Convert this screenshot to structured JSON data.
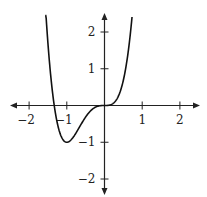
{
  "chart_data": {
    "type": "line",
    "title": "",
    "xlabel": "",
    "ylabel": "",
    "function": "f(x) = 3x^4 + 4x^3",
    "xlim": [
      -2.5,
      2.5
    ],
    "ylim": [
      -2.5,
      2.5
    ],
    "grid": false,
    "legend": null,
    "x_ticks": [
      -2,
      -1,
      1,
      2
    ],
    "x_tick_labels": [
      "−2",
      "−1",
      "1",
      "2"
    ],
    "y_ticks": [
      -2,
      -1,
      1,
      2
    ],
    "y_tick_labels": [
      "−2",
      "−1",
      "1",
      "2"
    ],
    "series": [
      {
        "name": "curve",
        "x": [
          -1.57,
          -1.5,
          -1.4,
          -1.333,
          -1.25,
          -1.1,
          -1.0,
          -0.9,
          -0.75,
          -0.5,
          -0.25,
          0.0,
          0.25,
          0.5,
          0.6,
          0.7,
          0.73
        ],
        "y": [
          2.45,
          1.69,
          0.55,
          0.0,
          -0.48,
          -0.93,
          -1.0,
          -0.95,
          -0.42,
          -0.31,
          -0.05,
          0.0,
          0.07,
          0.69,
          1.25,
          2.09,
          2.41
        ]
      }
    ],
    "annotations": {
      "local_min": [
        -1,
        -1
      ],
      "roots": [
        -1.333,
        0
      ]
    },
    "colors": {
      "axis": "#222222",
      "curve": "#111111",
      "background": "#ffffff"
    }
  }
}
